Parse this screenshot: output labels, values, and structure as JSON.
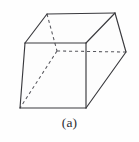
{
  "figure": {
    "caption": "(a)",
    "label": "prism-diagram",
    "shape_name": "oblique-rectangular-prism",
    "stroke_color": "#3a3a3e",
    "hidden_stroke_color": "#58585e",
    "background_color": "#fefefe",
    "face_fill_color": "#fdfdfd"
  },
  "geometry": {
    "vertices": {
      "top_back_left": [
        47,
        14
      ],
      "top_back_right": [
        115,
        13
      ],
      "top_front_left": [
        25,
        43
      ],
      "top_front_right": [
        86,
        43
      ],
      "bottom_front_left": [
        20,
        108
      ],
      "bottom_front_right": [
        86,
        108
      ],
      "bottom_back_right": [
        126,
        52
      ],
      "hidden_back_left": [
        57,
        51
      ]
    },
    "visible_edges": [
      [
        "top_back_left",
        "top_back_right"
      ],
      [
        "top_back_left",
        "top_front_left"
      ],
      [
        "top_front_left",
        "top_front_right"
      ],
      [
        "top_front_right",
        "top_back_right"
      ],
      [
        "top_front_left",
        "bottom_front_left"
      ],
      [
        "top_front_right",
        "bottom_front_right"
      ],
      [
        "bottom_front_left",
        "bottom_front_right"
      ],
      [
        "bottom_front_right",
        "bottom_back_right"
      ],
      [
        "top_back_right",
        "bottom_back_right"
      ]
    ],
    "hidden_edges": [
      [
        "top_back_left",
        "hidden_back_left"
      ],
      [
        "hidden_back_left",
        "bottom_back_right"
      ],
      [
        "hidden_back_left",
        "bottom_front_left"
      ]
    ]
  }
}
